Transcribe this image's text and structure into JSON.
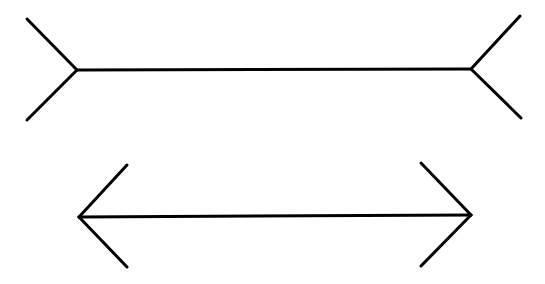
{
  "figure": {
    "title": "",
    "line_color": "#000000",
    "background": "#ffffff",
    "stroke_width": 3
  },
  "shapes": [
    {
      "name": "top-line-fins-out",
      "shaft": {
        "x1": 77,
        "y1": 70,
        "x2": 471,
        "y2": 69
      },
      "fins": [
        {
          "x1": 77,
          "y1": 70,
          "x2": 27,
          "y2": 19
        },
        {
          "x1": 77,
          "y1": 70,
          "x2": 27,
          "y2": 120
        },
        {
          "x1": 471,
          "y1": 69,
          "x2": 520,
          "y2": 16
        },
        {
          "x1": 471,
          "y1": 69,
          "x2": 521,
          "y2": 118
        }
      ]
    },
    {
      "name": "bottom-line-arrowheads",
      "shaft": {
        "x1": 79,
        "y1": 217,
        "x2": 471,
        "y2": 215
      },
      "fins": [
        {
          "x1": 79,
          "y1": 217,
          "x2": 127,
          "y2": 165
        },
        {
          "x1": 79,
          "y1": 217,
          "x2": 127,
          "y2": 267
        },
        {
          "x1": 471,
          "y1": 215,
          "x2": 421,
          "y2": 163
        },
        {
          "x1": 471,
          "y1": 215,
          "x2": 421,
          "y2": 266
        }
      ]
    }
  ]
}
